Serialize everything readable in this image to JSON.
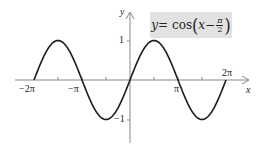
{
  "chart_data": {
    "type": "line",
    "function": "cos(x - pi/2)",
    "xlabel": "x",
    "ylabel": "y",
    "xlim": [
      -6.2832,
      6.2832
    ],
    "ylim": [
      -1,
      1
    ],
    "x_ticks": [
      {
        "value": -6.2832,
        "label": "−2π"
      },
      {
        "value": -4.7124,
        "label": ""
      },
      {
        "value": -3.1416,
        "label": "−π"
      },
      {
        "value": -1.5708,
        "label": ""
      },
      {
        "value": 1.5708,
        "label": ""
      },
      {
        "value": 3.1416,
        "label": "π"
      },
      {
        "value": 4.7124,
        "label": ""
      },
      {
        "value": 6.2832,
        "label": "2π"
      }
    ],
    "y_ticks": [
      {
        "value": 1,
        "label": "1"
      },
      {
        "value": -1,
        "label": "−1"
      }
    ],
    "series": [
      {
        "name": "y = cos(x − π/2)",
        "x": [
          -6.2832,
          -4.7124,
          -3.1416,
          -1.5708,
          0,
          1.5708,
          3.1416,
          4.7124,
          6.2832
        ],
        "values": [
          0,
          1,
          0,
          -1,
          0,
          1,
          0,
          -1,
          0
        ]
      }
    ],
    "grid": false,
    "legend": "none",
    "annotation": {
      "text": "y = cos(x − π/2)",
      "position": "top-right",
      "background": "#e2e2e2"
    }
  },
  "labels": {
    "equation_lhs": "y",
    "equation_eq": " = cos",
    "equation_x": "x",
    "equation_minus": " − ",
    "equation_num": "π",
    "equation_den": "2",
    "paren_open": "(",
    "paren_close": ")",
    "x_axis": "x",
    "y_axis": "y",
    "tick_neg_2pi": "−2π",
    "tick_neg_pi": "−π",
    "tick_pi": "π",
    "tick_2pi": "2π",
    "tick_y_pos1": "1",
    "tick_y_neg1": "−1"
  },
  "colors": {
    "curve": "#1a1a1a",
    "axis": "#888888",
    "box": "#e2e2e2"
  }
}
